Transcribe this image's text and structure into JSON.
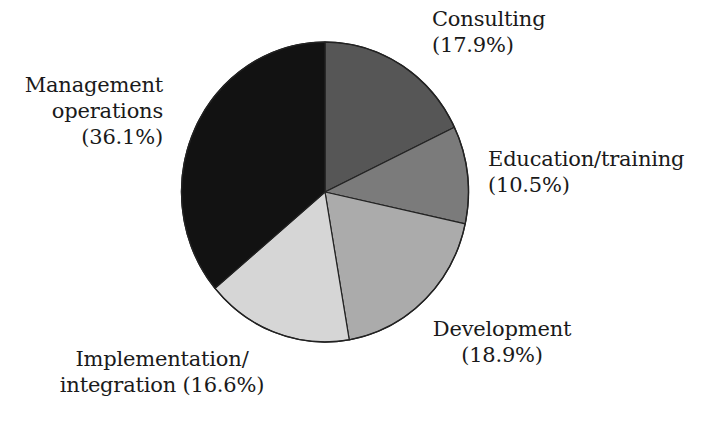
{
  "chart_data": {
    "type": "pie",
    "title": "",
    "start_angle_deg": 0,
    "direction": "clockwise",
    "categories": [
      "Consulting",
      "Education/training",
      "Development",
      "Implementation/integration",
      "Management operations"
    ],
    "values": [
      17.9,
      10.5,
      18.9,
      16.6,
      36.1
    ],
    "unit": "%",
    "colors": [
      "#565656",
      "#7b7b7b",
      "#ababab",
      "#d6d6d6",
      "#121212"
    ],
    "legend": "none (direct labels)",
    "slices": [
      {
        "name": "Consulting",
        "value": 17.9,
        "color": "#565656"
      },
      {
        "name": "Education/training",
        "value": 10.5,
        "color": "#7b7b7b"
      },
      {
        "name": "Development",
        "value": 18.9,
        "color": "#ababab"
      },
      {
        "name": "Implementation/integration",
        "value": 16.6,
        "color": "#d6d6d6"
      },
      {
        "name": "Management operations",
        "value": 36.1,
        "color": "#121212"
      }
    ]
  },
  "labels": {
    "consulting": {
      "line1": "Consulting",
      "line2": "(17.9%)"
    },
    "education": {
      "line1": "Education/training",
      "line2": "(10.5%)"
    },
    "development": {
      "line1": "Development",
      "line2": "(18.9%)"
    },
    "implementation": {
      "line1": "Implementation/",
      "line2": "integration (16.6%)"
    },
    "management": {
      "line1": "Management",
      "line2": "operations",
      "line3": "(36.1%)"
    }
  }
}
